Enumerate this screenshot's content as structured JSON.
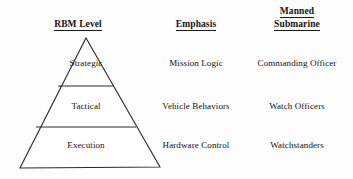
{
  "diagram": {
    "background_color": "#fdfdfd",
    "line_color": "#2a2a2a",
    "text_color": "#111111"
  },
  "headers": {
    "level": "RBM Level",
    "emphasis": "Emphasis",
    "manned_line1": "Manned",
    "manned_line2": "Submarine"
  },
  "rows": [
    {
      "level": "Strategic",
      "emphasis": "Mission Logic",
      "manned_submarine": "Commanding Officer"
    },
    {
      "level": "Tactical",
      "emphasis": "Vehicle Behaviors",
      "manned_submarine": "Watch Officers"
    },
    {
      "level": "Execution",
      "emphasis": "Hardware Control",
      "manned_submarine": "Watchstanders"
    }
  ],
  "pyramid": {
    "apex_x": 86,
    "apex_y": 38,
    "base_left_x": 20,
    "base_right_x": 160,
    "base_y": 168,
    "divider_1_y": 86,
    "divider_2_y": 127
  }
}
